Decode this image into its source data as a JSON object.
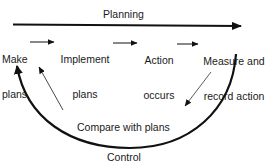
{
  "diagram": {
    "type": "control-loop",
    "top_arrow_label": "Planning",
    "bottom_arc_label": "Control",
    "nodes": [
      {
        "id": "make-plans",
        "line1": "Make",
        "line2": "plans"
      },
      {
        "id": "implement-plans",
        "line1": "Implement",
        "line2": "plans"
      },
      {
        "id": "action-occurs",
        "line1": "Action",
        "line2": "occurs"
      },
      {
        "id": "measure-record",
        "line1": "Measure and",
        "line2": "record action"
      }
    ],
    "compare_label": "Compare with plans",
    "edges": [
      {
        "from": "make-plans",
        "to": "implement-plans"
      },
      {
        "from": "implement-plans",
        "to": "action-occurs"
      },
      {
        "from": "action-occurs",
        "to": "measure-record"
      },
      {
        "from": "measure-record",
        "to": "compare-with-plans"
      },
      {
        "from": "compare-with-plans",
        "to": "make-plans"
      }
    ],
    "colors": {
      "line": "#111111",
      "background": "#ffffff"
    }
  }
}
